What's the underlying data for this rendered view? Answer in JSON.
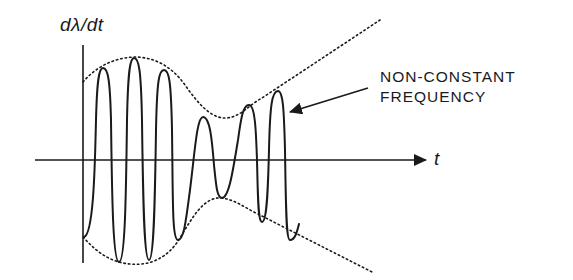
{
  "diagram": {
    "y_axis_label": "dλ/dt",
    "x_axis_label": "t",
    "annotation": {
      "line1": "NON-CONSTANT",
      "line2": "FREQUENCY"
    },
    "colors": {
      "ink": "#1a1a1a",
      "background": "#ffffff"
    },
    "elements": [
      {
        "name": "vertical-axis"
      },
      {
        "name": "horizontal-axis",
        "arrow": true
      },
      {
        "name": "waveform"
      },
      {
        "name": "upper-envelope",
        "style": "dotted"
      },
      {
        "name": "lower-envelope",
        "style": "dotted"
      },
      {
        "name": "annotation-arrow",
        "target": "waveform"
      }
    ]
  }
}
